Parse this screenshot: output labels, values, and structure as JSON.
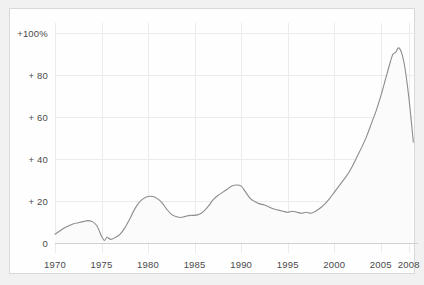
{
  "chart_data": {
    "type": "line",
    "title": "",
    "subtitle": "",
    "xlabel": "",
    "ylabel": "",
    "xlim": [
      1970,
      2009
    ],
    "ylim": [
      -5,
      105
    ],
    "grid": true,
    "legend": false,
    "legend_position": "none",
    "line_color": "#8c8c8c",
    "fill_color": "#fbfbfb",
    "axis_color": "#cfcfcf",
    "grid_color": "#ebebeb",
    "label_color": "#4a4a4a",
    "y_ticks": [
      0,
      20,
      40,
      60,
      80,
      100
    ],
    "y_tick_labels": [
      "0",
      "+ 20",
      "+ 40",
      "+ 60",
      "+ 80",
      "+100%"
    ],
    "x_ticks": [
      1970,
      1975,
      1980,
      1985,
      1990,
      1995,
      2000,
      2005,
      2008
    ],
    "x_tick_labels": [
      "1970",
      "1975",
      "1980",
      "1985",
      "1990",
      "1995",
      "2000",
      "2005",
      "2008"
    ],
    "series": [
      {
        "name": "cumulative-percent-change",
        "x": [
          1970.0,
          1970.5,
          1971.0,
          1971.5,
          1972.0,
          1972.5,
          1973.0,
          1973.5,
          1974.0,
          1974.5,
          1975.0,
          1975.3,
          1975.6,
          1976.0,
          1976.5,
          1977.0,
          1977.5,
          1978.0,
          1978.5,
          1979.0,
          1979.5,
          1980.0,
          1980.5,
          1981.0,
          1981.5,
          1982.0,
          1982.5,
          1983.0,
          1983.5,
          1984.0,
          1984.5,
          1985.0,
          1985.5,
          1986.0,
          1986.5,
          1987.0,
          1987.5,
          1988.0,
          1988.5,
          1989.0,
          1989.5,
          1990.0,
          1990.5,
          1991.0,
          1991.5,
          1992.0,
          1992.5,
          1993.0,
          1993.5,
          1994.0,
          1994.5,
          1995.0,
          1995.5,
          1996.0,
          1996.5,
          1997.0,
          1997.5,
          1998.0,
          1998.5,
          1999.0,
          1999.5,
          2000.0,
          2000.5,
          2001.0,
          2001.5,
          2002.0,
          2002.5,
          2003.0,
          2003.5,
          2004.0,
          2004.5,
          2005.0,
          2005.5,
          2006.0,
          2006.3,
          2006.6,
          2007.0,
          2007.5,
          2008.0,
          2008.5
        ],
        "y": [
          4.0,
          5.5,
          7.0,
          8.0,
          9.0,
          9.5,
          10.0,
          10.5,
          10.0,
          8.0,
          3.0,
          1.0,
          2.5,
          1.5,
          2.5,
          4.0,
          7.0,
          11.0,
          15.5,
          19.0,
          21.0,
          22.0,
          22.0,
          21.0,
          19.0,
          16.0,
          13.5,
          12.5,
          12.0,
          12.5,
          13.0,
          13.0,
          13.5,
          15.0,
          17.5,
          20.5,
          22.5,
          24.0,
          25.5,
          27.0,
          27.5,
          27.0,
          24.0,
          21.0,
          19.5,
          18.5,
          18.0,
          17.0,
          16.0,
          15.5,
          15.0,
          14.5,
          15.0,
          14.5,
          14.0,
          14.5,
          14.0,
          15.0,
          16.5,
          18.5,
          21.0,
          24.0,
          27.0,
          30.0,
          33.0,
          37.0,
          41.5,
          46.0,
          51.0,
          57.0,
          63.0,
          70.0,
          78.0,
          86.0,
          90.0,
          91.0,
          93.0,
          86.0,
          70.0,
          48.0
        ]
      }
    ]
  }
}
